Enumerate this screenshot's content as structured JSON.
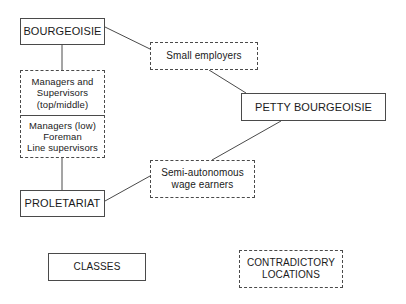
{
  "diagram": {
    "stroke_color": "#4a4a4a",
    "background_color": "#ffffff",
    "nodes": {
      "bourgeoisie": {
        "label": "BOURGEOISIE",
        "style": "solid"
      },
      "managers_stack": {
        "style": "dashed",
        "upper": {
          "line1": "Managers and",
          "line2": "Supervisors",
          "line3": "(top/middle)"
        },
        "lower": {
          "line1": "Managers (low)",
          "line2": "Foreman",
          "line3": "Line supervisors"
        }
      },
      "proletariat": {
        "label": "PROLETARIAT",
        "style": "solid"
      },
      "small_employers": {
        "label": "Small employers",
        "style": "dashed"
      },
      "petty_bourgeoisie": {
        "label": "PETTY BOURGEOISIE",
        "style": "solid"
      },
      "semi_autonomous": {
        "line1": "Semi-autonomous",
        "line2": "wage earners",
        "style": "dashed"
      }
    },
    "legend": {
      "classes": {
        "label": "CLASSES",
        "style": "solid"
      },
      "contradictory": {
        "line1": "CONTRADICTORY",
        "line2": "LOCATIONS",
        "style": "dashed"
      }
    },
    "connectors": [
      {
        "name": "bourgeoisie-to-managers",
        "from": "bourgeoisie",
        "to": "managers_stack",
        "x1": 62,
        "y1": 45,
        "x2": 62,
        "y2": 70
      },
      {
        "name": "managers-to-proletariat",
        "from": "managers_stack",
        "to": "proletariat",
        "x1": 62,
        "y1": 158,
        "x2": 62,
        "y2": 190
      },
      {
        "name": "bourgeoisie-to-small-employers",
        "from": "bourgeoisie",
        "to": "small_employers",
        "x1": 105,
        "y1": 27,
        "x2": 150,
        "y2": 49
      },
      {
        "name": "small-employers-to-petty-bourgeoisie",
        "from": "small_employers",
        "to": "petty_bourgeoisie",
        "x1": 209,
        "y1": 70,
        "x2": 246,
        "y2": 93
      },
      {
        "name": "petty-bourgeoisie-to-semi-autonomous",
        "from": "petty_bourgeoisie",
        "to": "semi_autonomous",
        "x1": 281,
        "y1": 121,
        "x2": 212,
        "y2": 160
      },
      {
        "name": "proletariat-to-semi-autonomous",
        "from": "proletariat",
        "to": "semi_autonomous",
        "x1": 105,
        "y1": 201,
        "x2": 150,
        "y2": 176
      }
    ]
  }
}
